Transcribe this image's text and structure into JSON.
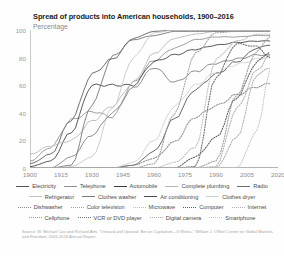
{
  "header": {
    "title": "Spread of products into American households, 1900–2016",
    "subtitle": "Percentage"
  },
  "chart_data": {
    "type": "line",
    "title": "Spread of products into American households, 1900–2016",
    "subtitle": "Percentage",
    "xlabel": "",
    "ylabel": "Percentage",
    "xlim": [
      1900,
      2020
    ],
    "ylim": [
      0,
      100
    ],
    "grid": false,
    "legend_position": "bottom",
    "xticks": [
      "1900",
      "1915",
      "1930",
      "1945",
      "1960",
      "1975",
      "1990",
      "2005",
      "2020"
    ],
    "yticks": [
      "0",
      "20",
      "40",
      "60",
      "80",
      "100"
    ],
    "x": [
      1900,
      1910,
      1920,
      1930,
      1940,
      1950,
      1960,
      1970,
      1980,
      1990,
      2000,
      2010,
      2016
    ],
    "series": [
      {
        "name": "Electricity",
        "color": "#555555",
        "dash": "solid",
        "values": [
          3,
          10,
          35,
          68,
          79,
          94,
          99,
          100,
          100,
          100,
          100,
          100,
          100
        ]
      },
      {
        "name": "Telephone",
        "color": "#8f8f8f",
        "dash": "solid",
        "values": [
          5,
          15,
          35,
          41,
          37,
          62,
          78,
          87,
          93,
          95,
          95,
          96,
          96
        ]
      },
      {
        "name": "Automobile",
        "color": "#3d3d3d",
        "dash": "solid",
        "values": [
          1,
          5,
          26,
          60,
          60,
          60,
          77,
          82,
          86,
          89,
          91,
          92,
          92
        ]
      },
      {
        "name": "Complete plumbing",
        "color": "#b5b5b5",
        "dash": "solid",
        "values": [
          10,
          16,
          20,
          34,
          45,
          62,
          83,
          94,
          97,
          99,
          99,
          99,
          99
        ]
      },
      {
        "name": "Radio",
        "color": "#6e6e6e",
        "dash": "solid",
        "values": [
          0,
          0,
          2,
          46,
          81,
          93,
          96,
          99,
          99,
          99,
          99,
          99,
          99
        ]
      },
      {
        "name": "Refrigerator",
        "color": "#c4c4c4",
        "dash": "solid",
        "values": [
          0,
          0,
          1,
          8,
          44,
          80,
          98,
          100,
          100,
          100,
          100,
          100,
          100
        ]
      },
      {
        "name": "Clothes washer",
        "color": "#7c7c7c",
        "dash": "solid",
        "values": [
          0,
          0,
          8,
          24,
          40,
          58,
          73,
          62,
          70,
          76,
          79,
          82,
          82
        ]
      },
      {
        "name": "Air conditioning",
        "color": "#4a4a4a",
        "dash": "solid",
        "values": [
          0,
          0,
          0,
          0,
          0,
          2,
          12,
          36,
          57,
          68,
          77,
          87,
          89
        ]
      },
      {
        "name": "Clothes dryer",
        "color": "#cfcfcf",
        "dash": "solid",
        "values": [
          0,
          0,
          0,
          0,
          0,
          4,
          20,
          45,
          60,
          69,
          75,
          79,
          81
        ]
      },
      {
        "name": "Dishwasher",
        "color": "#888888",
        "dash": "dotted",
        "values": [
          0,
          0,
          0,
          0,
          0,
          2,
          7,
          19,
          37,
          45,
          53,
          59,
          61
        ]
      },
      {
        "name": "Color television",
        "color": "#a0a0a0",
        "dash": "dotted",
        "values": [
          0,
          0,
          0,
          0,
          0,
          0,
          3,
          40,
          83,
          98,
          99,
          99,
          99
        ]
      },
      {
        "name": "Microwave",
        "color": "#bdbdbd",
        "dash": "dotted",
        "values": [
          0,
          0,
          0,
          0,
          0,
          0,
          0,
          4,
          15,
          79,
          92,
          97,
          97
        ]
      },
      {
        "name": "Computer",
        "color": "#5c5c5c",
        "dash": "dotted",
        "values": [
          0,
          0,
          0,
          0,
          0,
          0,
          0,
          0,
          8,
          22,
          51,
          77,
          84
        ]
      },
      {
        "name": "Internet",
        "color": "#b0b0b0",
        "dash": "dotted",
        "values": [
          0,
          0,
          0,
          0,
          0,
          0,
          0,
          0,
          0,
          1,
          43,
          71,
          82
        ]
      },
      {
        "name": "Cellphone",
        "color": "#9a9a9a",
        "dash": "dotted",
        "values": [
          0,
          0,
          0,
          0,
          0,
          0,
          0,
          0,
          0,
          5,
          53,
          85,
          95
        ]
      },
      {
        "name": "VCR or DVD player",
        "color": "#6b6b6b",
        "dash": "dotted",
        "values": [
          0,
          0,
          0,
          0,
          0,
          0,
          0,
          0,
          1,
          66,
          90,
          88,
          80
        ]
      },
      {
        "name": "Digital camera",
        "color": "#adadad",
        "dash": "dotted",
        "values": [
          0,
          0,
          0,
          0,
          0,
          0,
          0,
          0,
          0,
          0,
          22,
          68,
          72
        ]
      },
      {
        "name": "Smartphone",
        "color": "#c8c8c8",
        "dash": "dotted",
        "values": [
          0,
          0,
          0,
          0,
          0,
          0,
          0,
          0,
          0,
          0,
          0,
          27,
          71
        ]
      }
    ]
  },
  "legend": {
    "rows": [
      [
        {
          "label": "Electricity",
          "color": "#555555",
          "dash": "solid"
        },
        {
          "label": "Telephone",
          "color": "#8f8f8f",
          "dash": "solid"
        },
        {
          "label": "Automobile",
          "color": "#3d3d3d",
          "dash": "solid"
        },
        {
          "label": "Complete plumbing",
          "color": "#b5b5b5",
          "dash": "solid"
        },
        {
          "label": "Radio",
          "color": "#6e6e6e",
          "dash": "solid"
        }
      ],
      [
        {
          "label": "Refrigerator",
          "color": "#c4c4c4",
          "dash": "solid"
        },
        {
          "label": "Clothes washer",
          "color": "#7c7c7c",
          "dash": "solid"
        },
        {
          "label": "Air conditioning",
          "color": "#4a4a4a",
          "dash": "solid"
        },
        {
          "label": "Clothes dryer",
          "color": "#cfcfcf",
          "dash": "solid"
        }
      ],
      [
        {
          "label": "Dishwasher",
          "color": "#888888",
          "dash": "dotted"
        },
        {
          "label": "Color television",
          "color": "#a0a0a0",
          "dash": "dotted"
        },
        {
          "label": "Microwave",
          "color": "#bdbdbd",
          "dash": "dotted"
        },
        {
          "label": "Computer",
          "color": "#5c5c5c",
          "dash": "dotted"
        },
        {
          "label": "Internet",
          "color": "#b0b0b0",
          "dash": "dotted"
        }
      ],
      [
        {
          "label": "Cellphone",
          "color": "#9a9a9a",
          "dash": "dotted"
        },
        {
          "label": "VCR or DVD player",
          "color": "#6b6b6b",
          "dash": "dotted"
        },
        {
          "label": "Digital camera",
          "color": "#adadad",
          "dash": "dotted"
        },
        {
          "label": "Smartphone",
          "color": "#c8c8c8",
          "dash": "dotted"
        }
      ]
    ]
  },
  "source": {
    "text": "Source: W. Michael Cox and Richard Alm, \"Onward and Upward: Bet on Capitalism—It Works,\" William J. O'Neil Center for Global Markets and Freedom, 2001-2016 Annual Report."
  }
}
